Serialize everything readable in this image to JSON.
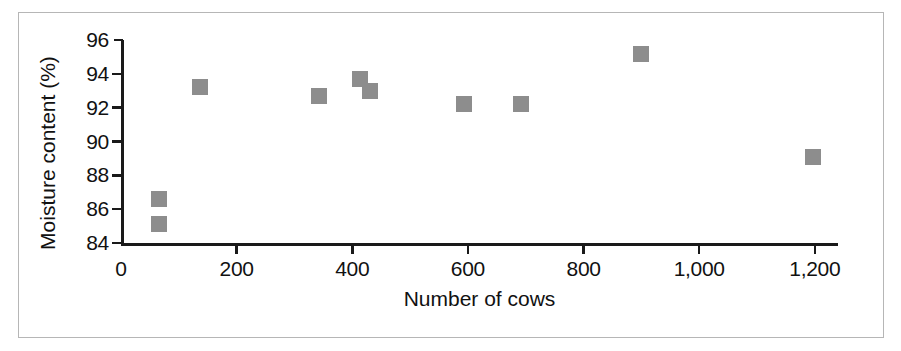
{
  "figure": {
    "frame_color": "#b6b6b6",
    "background": "#ffffff",
    "marker_color": "#8d8d8d",
    "axis_color": "#1a1a1a"
  },
  "chart_data": {
    "type": "scatter",
    "title": "",
    "xlabel": "Number of cows",
    "ylabel": "Moisture content (%)",
    "xlim": [
      0,
      1240
    ],
    "ylim": [
      84,
      96
    ],
    "xticks": [
      0,
      200,
      400,
      600,
      800,
      1000,
      1200
    ],
    "xticklabels": [
      "0",
      "200",
      "400",
      "600",
      "800",
      "1,000",
      "1,200"
    ],
    "yticks": [
      84,
      86,
      88,
      90,
      92,
      94,
      96
    ],
    "yticklabels": [
      "84",
      "86",
      "88",
      "90",
      "92",
      "94",
      "96"
    ],
    "grid": false,
    "legend": null,
    "marker": "square",
    "points": [
      {
        "x": 66,
        "y": 86.6,
        "label": "66, 86.6"
      },
      {
        "x": 66,
        "y": 85.1,
        "label": "66, 85.1"
      },
      {
        "x": 137,
        "y": 93.2,
        "label": "137, 93.2"
      },
      {
        "x": 343,
        "y": 92.7,
        "label": "343, 92.7"
      },
      {
        "x": 414,
        "y": 93.7,
        "label": "414, 93.7"
      },
      {
        "x": 431,
        "y": 93.0,
        "label": "431, 93.0"
      },
      {
        "x": 594,
        "y": 92.2,
        "label": "594, 92.2"
      },
      {
        "x": 691,
        "y": 92.2,
        "label": "691, 92.2"
      },
      {
        "x": 899,
        "y": 95.2,
        "label": "899, 95.2"
      },
      {
        "x": 1196,
        "y": 89.1,
        "label": "1196, 89.1"
      }
    ]
  }
}
